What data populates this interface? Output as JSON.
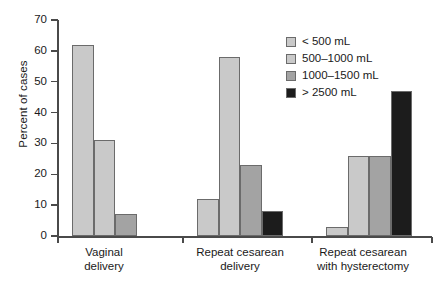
{
  "chart_data": {
    "type": "bar",
    "title": "",
    "xlabel": "",
    "ylabel": "Percent of cases",
    "ylim": [
      0,
      70
    ],
    "yticks": [
      0,
      10,
      20,
      30,
      40,
      50,
      60,
      70
    ],
    "ytick_labels": [
      "0",
      "10",
      "20",
      "30",
      "40",
      "50",
      "60",
      "70"
    ],
    "grid": false,
    "legend_position": "upper right",
    "categories": [
      "Vaginal\ndelivery",
      "Repeat cesarean\ndelivery",
      "Repeat cesarean\nwith hysterectomy"
    ],
    "series": [
      {
        "name": "< 500 mL",
        "color": "#c9c9c9",
        "values": [
          62,
          12,
          3
        ]
      },
      {
        "name": "500–1000 mL",
        "color": "#c9c9c9",
        "values": [
          31,
          58,
          26
        ]
      },
      {
        "name": "1000–1500 mL",
        "color": "#a3a3a3",
        "values": [
          7,
          23,
          26
        ]
      },
      {
        "name": "> 2500 mL",
        "color": "#1c1c1c",
        "values": [
          null,
          8,
          47
        ]
      }
    ],
    "legend": [
      {
        "label": "< 500 mL",
        "color": "#c9c9c9"
      },
      {
        "label": "500–1000 mL",
        "color": "#c9c9c9"
      },
      {
        "label": "1000–1500 mL",
        "color": "#a3a3a3"
      },
      {
        "label": "> 2500 mL",
        "color": "#1c1c1c"
      }
    ],
    "axis_color": "#4a4a4a",
    "bar_edge_color": "#6b6b6b"
  }
}
